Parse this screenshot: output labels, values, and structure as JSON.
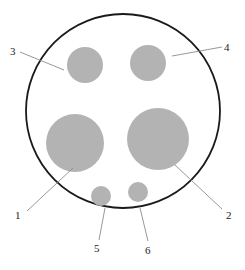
{
  "figure": {
    "type": "cross-section-diagram",
    "canvas": {
      "width": 245,
      "height": 270,
      "background": "#ffffff"
    },
    "colors": {
      "outline": "#1a1a1a",
      "region_fill": "#b3b3b3",
      "leader_line": "#8c8c8c",
      "label_text": "#222222"
    },
    "boundary": {
      "name": "outer-circle",
      "cx": 123,
      "cy": 111,
      "r": 97,
      "stroke_width": 1.8
    },
    "regions": [
      {
        "id": "1",
        "name": "region-1-large-left",
        "cx": 75,
        "cy": 143,
        "r": 29
      },
      {
        "id": "2",
        "name": "region-2-large-right",
        "cx": 158,
        "cy": 139,
        "r": 31
      },
      {
        "id": "3",
        "name": "region-3-upper-left",
        "cx": 85,
        "cy": 65,
        "r": 18
      },
      {
        "id": "4",
        "name": "region-4-upper-right",
        "cx": 148,
        "cy": 63,
        "r": 18
      },
      {
        "id": "5",
        "name": "region-5-small-left",
        "cx": 101,
        "cy": 196,
        "r": 10
      },
      {
        "id": "6",
        "name": "region-6-small-right",
        "cx": 138,
        "cy": 192,
        "r": 10
      }
    ],
    "callouts": [
      {
        "id": "1",
        "label": "1",
        "label_x": 15,
        "label_y": 210,
        "leader": {
          "x1": 27,
          "y1": 211,
          "x2": 73,
          "y2": 168
        }
      },
      {
        "id": "2",
        "label": "2",
        "label_x": 226,
        "label_y": 210,
        "leader": {
          "x1": 222,
          "y1": 209,
          "x2": 175,
          "y2": 165
        }
      },
      {
        "id": "3",
        "label": "3",
        "label_x": 10,
        "label_y": 46,
        "leader": {
          "x1": 20,
          "y1": 52,
          "x2": 64,
          "y2": 70
        }
      },
      {
        "id": "4",
        "label": "4",
        "label_x": 224,
        "label_y": 42,
        "leader": {
          "x1": 222,
          "y1": 47,
          "x2": 172,
          "y2": 56
        }
      },
      {
        "id": "5",
        "label": "5",
        "label_x": 94,
        "label_y": 243,
        "leader": {
          "x1": 99,
          "y1": 240,
          "x2": 105,
          "y2": 208
        }
      },
      {
        "id": "6",
        "label": "6",
        "label_x": 145,
        "label_y": 245,
        "leader": {
          "x1": 148,
          "y1": 241,
          "x2": 140,
          "y2": 208
        }
      }
    ]
  }
}
